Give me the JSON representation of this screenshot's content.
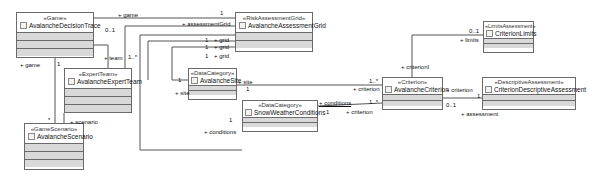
{
  "diagram": {
    "type": "UML class diagram",
    "classes": [
      {
        "id": "game",
        "stereotype": "«Game»",
        "name": "AvalancheDecisionTrace"
      },
      {
        "id": "grid",
        "stereotype": "«RiskAssessmentGrid»",
        "name": "AvalancheAssessmentGrid"
      },
      {
        "id": "limits",
        "stereotype": "«LimitsAssessment»",
        "name": "CriterionLimits"
      },
      {
        "id": "team",
        "stereotype": "«ExpertTeam»",
        "name": "AvalancheExpertTeam"
      },
      {
        "id": "site",
        "stereotype": "«DataCategory»",
        "name": "AvalancheSite"
      },
      {
        "id": "conditions",
        "stereotype": "«DataCategory»",
        "name": "SnowWeatherConditions"
      },
      {
        "id": "criterion",
        "stereotype": "«Criterion»",
        "name": "AvalancheCriterion"
      },
      {
        "id": "descriptive",
        "stereotype": "«DescriptiveAssessment»",
        "name": "CriterionDescriptiveAssessment"
      },
      {
        "id": "scenario",
        "stereotype": "«GameScenario»",
        "name": "AvalancheScenario"
      }
    ],
    "labels": {
      "game_grid_role": "+ game",
      "game_grid_mult_game": "0..1",
      "game_grid_mult_grid": "1",
      "game_grid_role_grid": "+ assessmentGrid",
      "team_role": "+ team",
      "team_mult": "1..*",
      "team_mult_game": "1",
      "grid_site_mult1": "1",
      "grid_site_role1": "+ grid",
      "grid_site_mult2": "1",
      "grid_site_role2": "+ grid",
      "grid_site_mult3": "1",
      "grid_site_role3": "+ grid",
      "site_mult_left": "1",
      "site_role_left": "+ site",
      "site_role_right": "+ site",
      "site_mult_right": "1",
      "site_crit_mult": "1..*",
      "site_crit_role": "+ criterion",
      "cond_role_right": "+ conditions",
      "cond_mult_right": "1",
      "cond_crit_mult": "1..*",
      "cond_crit_role": "+ criterion",
      "cond_left_mult": "1",
      "cond_left_role": "+ conditions",
      "game_scenario_role": "+ game",
      "scenario_mult": "*",
      "scenario_role": "+ scenario",
      "limits_mult": "0..1",
      "limits_role": "+ limits",
      "criterionI_role": "+ criterionI",
      "desc_role_crit": "+ criterion",
      "desc_mult_crit": "1",
      "desc_mult_assess": "0..1",
      "desc_role_assess": "+ assessment"
    }
  }
}
